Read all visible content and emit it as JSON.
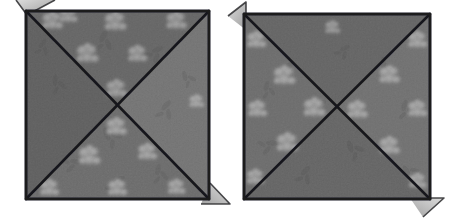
{
  "image": {
    "kind": "photograph",
    "subject": "two folded fabric napkin squares",
    "style": "black-and-white grayscale photo",
    "width": 458,
    "height": 222,
    "background_color": "#ffffff",
    "caption_text": "",
    "visible_text": []
  },
  "palette": {
    "background": "#ffffff",
    "fabric_mid": "#6f6f6f",
    "fabric_dark": "#5c5c5c",
    "fabric_light": "#7e7e7e",
    "fabric_shadow": "#4e4e4e",
    "crease_line": "#17171a",
    "border_line": "#1b1b1e",
    "flap_light": "#c9c9c9",
    "flap_mid": "#a8a8a8",
    "flap_edge": "#2a2a2d",
    "floral_white": "#f2f2f2",
    "floral_soft": "#d8d8d8",
    "noise_dark": "#555555",
    "noise_light": "#888888"
  },
  "panels": [
    {
      "id": "left-napkin",
      "label": "Left folded napkin square",
      "square": {
        "x": 26,
        "y": 11,
        "width": 183,
        "height": 188
      },
      "rotation_deg": -0.6,
      "creases": [
        {
          "name": "diagonal-tl-br",
          "from": [
            26,
            11
          ],
          "to": [
            209,
            199
          ]
        },
        {
          "name": "diagonal-tr-bl",
          "from": [
            209,
            11
          ],
          "to": [
            26,
            199
          ]
        }
      ],
      "quadrants": [
        {
          "name": "top-triangle",
          "tone": "#6a6a6a"
        },
        {
          "name": "right-triangle",
          "tone": "#767676"
        },
        {
          "name": "bottom-triangle",
          "tone": "#6e6e6e"
        },
        {
          "name": "left-triangle",
          "tone": "#646464"
        }
      ],
      "flaps": [
        {
          "name": "flap-top-left",
          "corner": "top-left",
          "points": "18,1 52,1 26,14",
          "tone": "#c4c4c4"
        },
        {
          "name": "flap-bottom-right",
          "corner": "bottom-right",
          "points": "209,186 228,203 203,203",
          "tone": "#c4c4c4"
        }
      ],
      "floral_motifs": [
        {
          "cx": 52,
          "cy": 22,
          "r": 9
        },
        {
          "cx": 70,
          "cy": 19,
          "r": 7
        },
        {
          "cx": 115,
          "cy": 24,
          "r": 10
        },
        {
          "cx": 178,
          "cy": 24,
          "r": 9
        },
        {
          "cx": 88,
          "cy": 56,
          "r": 10
        },
        {
          "cx": 138,
          "cy": 56,
          "r": 9
        },
        {
          "cx": 117,
          "cy": 90,
          "r": 9
        },
        {
          "cx": 117,
          "cy": 128,
          "r": 9
        },
        {
          "cx": 90,
          "cy": 157,
          "r": 10
        },
        {
          "cx": 148,
          "cy": 155,
          "r": 9
        },
        {
          "cx": 50,
          "cy": 190,
          "r": 9
        },
        {
          "cx": 118,
          "cy": 190,
          "r": 9
        },
        {
          "cx": 178,
          "cy": 190,
          "r": 8
        }
      ]
    },
    {
      "id": "right-napkin",
      "label": "Right folded napkin square",
      "square": {
        "x": 244,
        "y": 14,
        "width": 186,
        "height": 185
      },
      "rotation_deg": 0.4,
      "creases": [
        {
          "name": "diagonal-tl-br",
          "from": [
            244,
            14
          ],
          "to": [
            430,
            199
          ]
        },
        {
          "name": "diagonal-tr-bl",
          "from": [
            430,
            14
          ],
          "to": [
            244,
            199
          ]
        }
      ],
      "quadrants": [
        {
          "name": "top-triangle",
          "tone": "#6a6a6a"
        },
        {
          "name": "right-triangle",
          "tone": "#737373"
        },
        {
          "name": "bottom-triangle",
          "tone": "#6b6b6b"
        },
        {
          "name": "left-triangle",
          "tone": "#6f6f6f"
        }
      ],
      "flaps": [
        {
          "name": "flap-top-left",
          "corner": "top-left",
          "points": "230,14 246,3 246,28",
          "tone": "#c4c4c4"
        },
        {
          "name": "flap-bottom-right",
          "corner": "bottom-right",
          "points": "414,199 442,199 424,215",
          "tone": "#c4c4c4"
        }
      ],
      "floral_motifs": [
        {
          "cx": 256,
          "cy": 42,
          "r": 9
        },
        {
          "cx": 418,
          "cy": 42,
          "r": 9
        },
        {
          "cx": 285,
          "cy": 78,
          "r": 10
        },
        {
          "cx": 390,
          "cy": 78,
          "r": 9
        },
        {
          "cx": 258,
          "cy": 112,
          "r": 9
        },
        {
          "cx": 315,
          "cy": 110,
          "r": 10
        },
        {
          "cx": 358,
          "cy": 112,
          "r": 9
        },
        {
          "cx": 418,
          "cy": 112,
          "r": 9
        },
        {
          "cx": 288,
          "cy": 145,
          "r": 10
        },
        {
          "cx": 390,
          "cy": 148,
          "r": 9
        },
        {
          "cx": 256,
          "cy": 180,
          "r": 8
        },
        {
          "cx": 418,
          "cy": 184,
          "r": 8
        }
      ]
    }
  ]
}
